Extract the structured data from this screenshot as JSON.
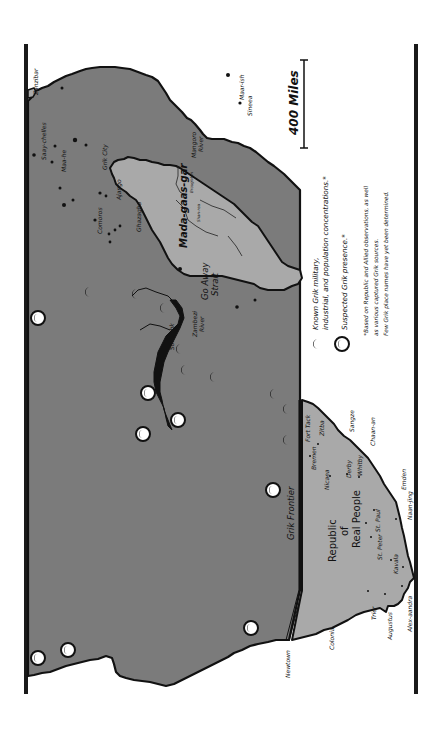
{
  "map": {
    "orientation": "rotated 90 degrees clockwise",
    "colors": {
      "background": "#ffffff",
      "grik_territory": "#7b7b7b",
      "republic_territory": "#a9a9a9",
      "madagascar": "#a9a9a9",
      "coastline": "#111111",
      "frame": "#1a1a1a"
    },
    "regions": {
      "republic": "Republic of Real People",
      "republic_lines": [
        "Republic",
        "of",
        "Real People"
      ],
      "madagascar": "Mada-gaas-gar",
      "frontier": "Grik Frontier",
      "strait_line1": "Go Away",
      "strait_line2": "Strait"
    },
    "places": {
      "zanzibar": "Zanzibar",
      "sofesshk": "Sofesshk",
      "zambezi_line1": "Zambezi",
      "zambezi_line2": "River",
      "grik_city": "Grik City",
      "ajango": "Ajango",
      "ghazagha": "Ghazagha",
      "comoros": "Comoros",
      "saay_chelles": "Saay-chelles",
      "maa_he": "Maa-he",
      "maar_ish": "Maar-ish",
      "sineea": "Sineea",
      "mangoro_line1": "Mangoro",
      "mangoro_line2": "River",
      "broughton": "Broughton",
      "shan_rea": "Shan-rea",
      "fort_tack": "Fort Tack",
      "zitba": "Zitba",
      "sangze": "Sangze",
      "chaan_an": "Chaan-an",
      "bremen": "Bremen",
      "nicaea": "Nicaea",
      "derby": "Derby",
      "whitby": "Whitby",
      "emden": "Emden",
      "naan_jing": "Naan-jing",
      "st_paul": "St. Paul",
      "st_peter": "St. Peter",
      "kavala": "Kavala",
      "alex_aandra": "Alex-aandra",
      "augustus": "Augustus",
      "trier": "Trier",
      "colonia": "Colonia",
      "newtown": "Newtown"
    },
    "scale": {
      "label": "400 Miles"
    },
    "legend": {
      "known_line1": "Known Grik military,",
      "known_line2": "industrial, and population concentrations.*",
      "suspected": "Suspected Grik presence.*",
      "note_line1": "*Based on Republic and Allied observations, as well",
      "note_line2": "as various captured Grik sources.",
      "note_line3": "Few Grik place names have yet been determined."
    }
  }
}
